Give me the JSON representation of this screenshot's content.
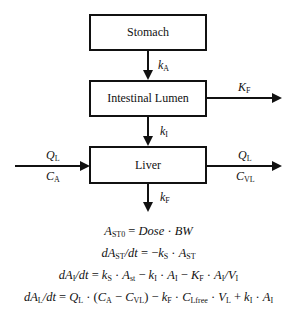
{
  "diagram": {
    "type": "pharmacokinetic-compartment-flowchart",
    "compartments": [
      {
        "id": "stomach",
        "label": "Stomach"
      },
      {
        "id": "intestinal_lumen",
        "label": "Intestinal Lumen"
      },
      {
        "id": "liver",
        "label": "Liver"
      }
    ],
    "arrows": [
      {
        "from": "stomach",
        "to": "intestinal_lumen",
        "label": {
          "base": "k",
          "sub": "A"
        }
      },
      {
        "from": "intestinal_lumen",
        "to": "out-right",
        "label": {
          "base": "K",
          "sub": "F"
        }
      },
      {
        "from": "intestinal_lumen",
        "to": "liver",
        "label": {
          "base": "k",
          "sub": "I"
        }
      },
      {
        "from": "in-left",
        "to": "liver",
        "label_top": {
          "base": "Q",
          "sub": "L"
        },
        "label_bottom": {
          "base": "C",
          "sub": "A"
        }
      },
      {
        "from": "liver",
        "to": "out-right",
        "label_top": {
          "base": "Q",
          "sub": "L"
        },
        "label_bottom": {
          "base": "C",
          "sub": "VL"
        }
      },
      {
        "from": "liver",
        "to": "out-down",
        "label": {
          "base": "k",
          "sub": "F"
        }
      }
    ]
  },
  "labels": {
    "kA": {
      "base": "k",
      "sub": "A"
    },
    "KF_lumen": {
      "base": "K",
      "sub": "F"
    },
    "kI": {
      "base": "k",
      "sub": "I"
    },
    "QL_in": {
      "base": "Q",
      "sub": "L"
    },
    "CA_in": {
      "base": "C",
      "sub": "A"
    },
    "QL_out": {
      "base": "Q",
      "sub": "L"
    },
    "CVL_out": {
      "base": "C",
      "sub": "VL"
    },
    "kF_liver": {
      "base": "k",
      "sub": "F"
    }
  },
  "equations": {
    "eq1": "A_ST0 = Dose · BW",
    "eq2": "dA_ST/dt = −k_S · A_ST",
    "eq3": "dA_I/dt = k_S · A_st − k_I · A_I − K_F · A_I/V_I",
    "eq4": "dA_L/dt = Q_L · (C_A − C_VL) − k_F · C_Lfree · V_L + k_I · A_I",
    "parts": {
      "A": "A",
      "ST0": "ST0",
      "eq": " = ",
      "Dose": "Dose",
      "dot": " · ",
      "BW": "BW",
      "d": "d",
      "ST": "ST",
      "slash_dt": "/dt",
      "minus": " − ",
      "k": "k",
      "S": "S",
      "I": "I",
      "st": "st",
      "K": "K",
      "F": "F",
      "V": "V",
      "L": "L",
      "Q": "Q",
      "lparen": "(",
      "rparen": ")",
      "C": "C",
      "VL": "VL",
      "Lfree": "Lfree",
      "plus": " + ",
      "slash": "/"
    }
  }
}
